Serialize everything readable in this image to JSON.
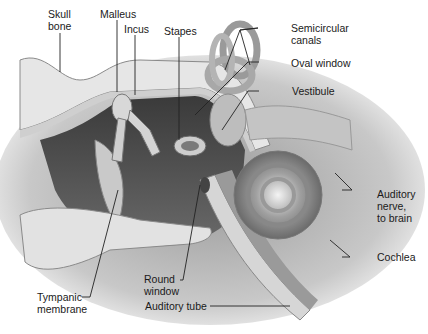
{
  "labels": {
    "skull_bone": "Skull\nbone",
    "malleus": "Malleus",
    "incus": "Incus",
    "stapes": "Stapes",
    "semicircular_canals": "Semicircular\ncanals",
    "oval_window": "Oval window",
    "vestibule": "Vestibule",
    "auditory_nerve": "Auditory\nnerve,\nto brain",
    "cochlea": "Cochlea",
    "round_window": "Round\nwindow",
    "tympanic_membrane": "Tympanic\nmembrane",
    "auditory_tube": "Auditory tube"
  },
  "colors": {
    "background": "#ffffff",
    "bone": "#e8e8e8",
    "bone_edge": "#8a8a8a",
    "cavity": "#4a4a4a",
    "tissue": "#b8b8b8",
    "leader": "#222222"
  }
}
